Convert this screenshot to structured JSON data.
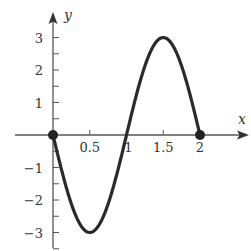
{
  "chart_data": {
    "type": "line",
    "title": "",
    "xlabel": "x",
    "ylabel": "y",
    "function": "y = -3 sin(pi x)",
    "xlim": [
      -0.5,
      2.6
    ],
    "ylim": [
      -3.5,
      3.7
    ],
    "grid": false,
    "legend": null,
    "x_ticks": [
      0.5,
      1,
      1.5,
      2
    ],
    "x_tick_labels": [
      "0.5",
      "1",
      "1.5",
      "2"
    ],
    "y_ticks": [
      -3,
      -2,
      -1,
      1,
      2,
      3
    ],
    "y_tick_labels": [
      "−3",
      "−2",
      "−1",
      "1",
      "2",
      "3"
    ],
    "y_minor_ticks": [
      -3.5,
      -2.5,
      -1.5,
      -0.5,
      0.5,
      1.5,
      2.5
    ],
    "series": [
      {
        "name": "curve",
        "x": [
          0,
          0.25,
          0.5,
          0.75,
          1,
          1.25,
          1.5,
          1.75,
          2
        ],
        "y": [
          0,
          -2.12,
          -3,
          -2.12,
          0,
          2.12,
          3,
          2.12,
          0
        ]
      }
    ],
    "endpoints": [
      {
        "x": 0,
        "y": 0,
        "filled": true
      },
      {
        "x": 2,
        "y": 0,
        "filled": true
      }
    ],
    "extrema": [
      {
        "x": 0.5,
        "y": -3,
        "kind": "min"
      },
      {
        "x": 1.5,
        "y": 3,
        "kind": "max"
      }
    ],
    "colors": {
      "axis": "#555555",
      "curve": "#2a2a2a",
      "text": "#333333"
    }
  }
}
